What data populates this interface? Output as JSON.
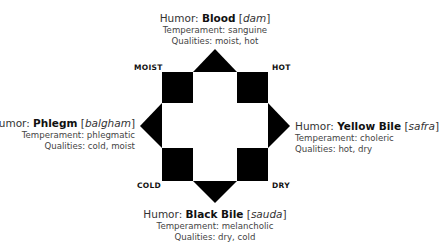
{
  "diagram": {
    "colors": {
      "shape": "#000000",
      "background": "#ffffff",
      "text": "#333333"
    },
    "qualities": {
      "top_left": "MOIST",
      "top_right": "HOT",
      "bottom_left": "COLD",
      "bottom_right": "DRY"
    },
    "humors": {
      "top": {
        "prefix": "Humor: ",
        "name": "Blood",
        "native_open": " [",
        "native": "dam",
        "native_close": "]",
        "temperament": "Temperament: sanguine",
        "qualities": "Qualities: moist, hot"
      },
      "left": {
        "prefix": "Humor: ",
        "name": "Phlegm",
        "native_open": " [",
        "native": "balgham",
        "native_close": "]",
        "temperament": "Temperament: phlegmatic",
        "qualities": "Qualities: cold, moist"
      },
      "right": {
        "prefix": "Humor: ",
        "name": "Yellow Bile",
        "native_open": " [",
        "native": "safra",
        "native_close": "]",
        "temperament": "Temperament: choleric",
        "qualities": "Qualities: hot, dry"
      },
      "bottom": {
        "prefix": "Humor: ",
        "name": "Black Bile",
        "native_open": " [",
        "native": "sauda",
        "native_close": "]",
        "temperament": "Temperament: melancholic",
        "qualities": "Qualities: dry, cold"
      }
    }
  }
}
